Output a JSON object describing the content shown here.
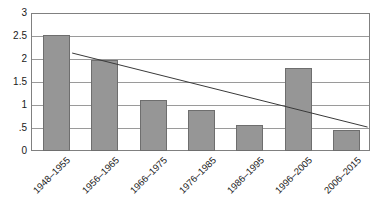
{
  "chart_data": {
    "type": "bar",
    "title": "",
    "subtitle": "",
    "xlabel": "",
    "ylabel": "",
    "categories": [
      "1948–1955",
      "1956–1965",
      "1966–1975",
      "1976–1985",
      "1986–1995",
      "1996–2005",
      "2006–2015"
    ],
    "values": [
      2.55,
      2.0,
      1.12,
      0.9,
      0.58,
      1.82,
      0.45
    ],
    "ylim": [
      0,
      3
    ],
    "ytick_labels": [
      "3",
      "2.5",
      "2",
      "1.5",
      "1",
      ".5",
      "0"
    ],
    "ytick_values": [
      3,
      2.5,
      2,
      1.5,
      1,
      0.5,
      0
    ],
    "grid": true,
    "grid_axis": "y",
    "legend": false,
    "legend_position": "none",
    "series": [
      {
        "name": "bars",
        "type": "bar",
        "color": "#969696",
        "edge_color": "#6e6e6e",
        "values": [
          2.55,
          2.0,
          1.12,
          0.9,
          0.58,
          1.82,
          0.45
        ]
      },
      {
        "name": "trendline",
        "type": "line",
        "color": "#3a3a3a",
        "x": [
          0.35,
          6.45
        ],
        "y": [
          2.13,
          0.52
        ]
      }
    ],
    "annotations": []
  },
  "colors": {
    "bar_fill": "#969696",
    "bar_edge": "#6e6e6e",
    "gridline": "#9a9a9a",
    "frame": "#808080",
    "trendline": "#3a3a3a",
    "text": "#1a1a1a",
    "background": "#ffffff"
  }
}
